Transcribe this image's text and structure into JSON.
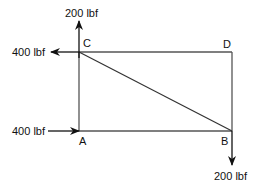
{
  "diagram": {
    "type": "rectangular frame with diagonal member and applied forces",
    "points": {
      "A": {
        "label": "A"
      },
      "B": {
        "label": "B"
      },
      "C": {
        "label": "C"
      },
      "D": {
        "label": "D"
      }
    },
    "forces": [
      {
        "at": "C",
        "direction": "up",
        "label": "200 lbf"
      },
      {
        "at": "C",
        "direction": "left",
        "label": "400 lbf"
      },
      {
        "at": "A",
        "direction": "right",
        "label": "400 lbf"
      },
      {
        "at": "B",
        "direction": "down",
        "label": "200 lbf"
      }
    ],
    "members": [
      "A-B",
      "B-D",
      "D-C",
      "C-A",
      "C-B"
    ],
    "colors": {
      "line": "#555555",
      "arrow": "#111111",
      "text": "#111111"
    }
  }
}
